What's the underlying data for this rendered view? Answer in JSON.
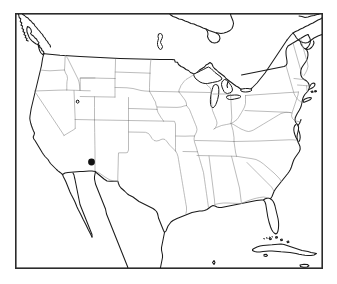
{
  "figure": {
    "type": "map",
    "title": "",
    "subject": "United States state outline map",
    "background_color": "#ffffff",
    "width": 337,
    "height": 284
  },
  "frame": {
    "name": "map-border",
    "x": 15,
    "y": 13,
    "width": 308,
    "height": 256,
    "stroke_color": "#2b2b2b",
    "stroke_width": 1.6
  },
  "styles": {
    "coastline_color": "#1a1a1a",
    "state_border_color": "#8f8f8f",
    "international_border_color": "#1a1a1a",
    "lake_fill": "#ffffff",
    "marker_color": "#111111"
  },
  "markers": [
    {
      "name": "location-marker",
      "label": "",
      "state": "Arizona",
      "x": 91.5,
      "y": 162,
      "radius": 3.4,
      "color": "#111111",
      "shape": "filled-circle"
    }
  ],
  "legend": {
    "visible": false,
    "entries": []
  },
  "labels": {
    "visible": false,
    "items": []
  },
  "features": {
    "great_lakes": [
      "Lake Superior",
      "Lake Michigan",
      "Lake Huron",
      "Lake Erie",
      "Lake Ontario"
    ],
    "other_water": [
      "Lake Winnipeg",
      "Great Salt Lake"
    ],
    "neighbors": [
      "Canada",
      "Mexico",
      "Cuba",
      "Bahamas"
    ],
    "peninsulas": [
      "Florida",
      "Baja California",
      "Cape Cod",
      "Delmarva"
    ]
  },
  "annotations": {
    "axis_visible": false,
    "gridlines": false,
    "scale_bar": false,
    "north_arrow": false
  }
}
